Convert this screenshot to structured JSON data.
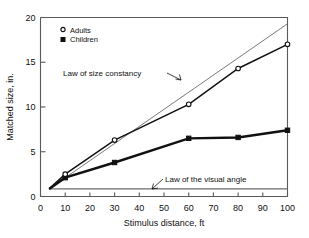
{
  "chart_data": {
    "type": "line",
    "title": "",
    "xlabel": "Stimulus distance, ft",
    "ylabel": "Matched size, in.",
    "xlim": [
      0,
      100
    ],
    "ylim": [
      0,
      20
    ],
    "xticks": [
      0,
      10,
      20,
      30,
      40,
      50,
      60,
      70,
      80,
      90,
      100
    ],
    "yticks": [
      0,
      5,
      10,
      15,
      20
    ],
    "xtick_labels": [
      "0",
      "10",
      "20",
      "30",
      "40",
      "50",
      "60",
      "70",
      "80",
      "90",
      "100"
    ],
    "ytick_labels": [
      "0",
      "5",
      "10",
      "15",
      "20"
    ],
    "grid": false,
    "legend_position": "top-left",
    "series": [
      {
        "name": "Adults",
        "marker": "open-circle",
        "x": [
          3.5,
          10,
          30,
          60,
          80,
          100
        ],
        "values": [
          0.85,
          2.5,
          6.3,
          10.3,
          14.3,
          17.0
        ]
      },
      {
        "name": "Children",
        "marker": "filled-square",
        "x": [
          3.5,
          10,
          30,
          60,
          80,
          100
        ],
        "values": [
          0.85,
          2.1,
          3.8,
          6.5,
          6.6,
          7.4
        ]
      }
    ],
    "reference_lines": [
      {
        "name": "Law of size constancy",
        "style": "thin-solid",
        "x": [
          3.5,
          100
        ],
        "values": [
          0.85,
          19.3
        ]
      },
      {
        "name": "Law of the visual angle",
        "style": "thin-solid",
        "x": [
          3.5,
          100
        ],
        "values": [
          0.85,
          0.85
        ]
      }
    ],
    "annotations": [
      {
        "text": "Law of size constancy",
        "target_x": 63,
        "target_y": 12.3
      },
      {
        "text": "Law of the visual angle",
        "target_x": 50,
        "target_y": 0.85
      }
    ]
  },
  "legend": {
    "items": [
      {
        "label": "Adults",
        "marker": "open-circle"
      },
      {
        "label": "Children",
        "marker": "filled-square"
      }
    ]
  },
  "axes": {
    "x_title": "Stimulus distance, ft",
    "y_title": "Matched size, in."
  }
}
